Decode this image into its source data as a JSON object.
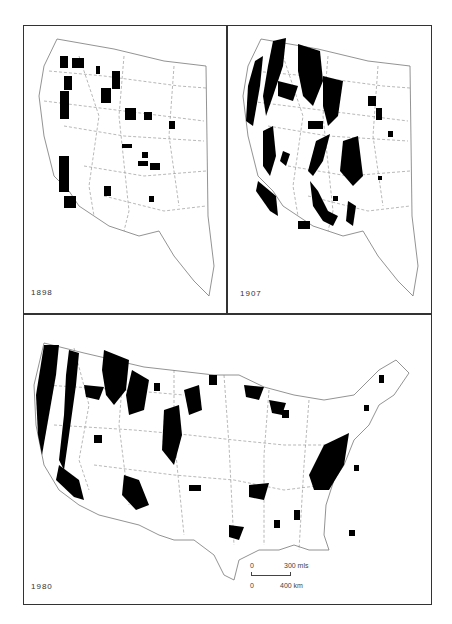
{
  "figure": {
    "panels": [
      {
        "id": "1898",
        "year_label": "1898",
        "region": "Western United States"
      },
      {
        "id": "1907",
        "year_label": "1907",
        "region": "Western United States"
      },
      {
        "id": "1980",
        "year_label": "1980",
        "region": "Contiguous United States"
      }
    ],
    "scale_bar": {
      "miles_zero": "0",
      "miles_label": "300 mls",
      "km_zero": "0",
      "km_label": "400 km"
    },
    "colors": {
      "land_fill": "#ffffff",
      "forest_fill": "#000000",
      "outline": "#555555",
      "frame": "#333333"
    }
  }
}
